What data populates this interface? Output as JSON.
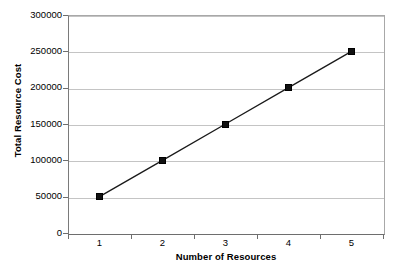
{
  "chart_data": {
    "type": "line",
    "title": "",
    "xlabel": "Number of Resources",
    "ylabel": "Total Resource Cost",
    "categories": [
      "1",
      "2",
      "3",
      "4",
      "5"
    ],
    "values": [
      50000,
      100000,
      150000,
      200000,
      250000
    ],
    "series": [
      {
        "name": "Total Resource Cost",
        "values": [
          50000,
          100000,
          150000,
          200000,
          250000
        ]
      }
    ],
    "ylim": [
      0,
      300000
    ],
    "ytick_labels": [
      "0",
      "50000",
      "100000",
      "150000",
      "200000",
      "250000",
      "300000"
    ],
    "ytick_values": [
      0,
      50000,
      100000,
      150000,
      200000,
      250000,
      300000
    ],
    "xtick_labels": [
      "1",
      "2",
      "3",
      "4",
      "5"
    ],
    "grid": "horizontal",
    "grid_color": "#c4c4c4",
    "legend": "none",
    "marker": "square",
    "marker_color": "#111111",
    "line_color": "#1a1a1a",
    "background": "#ffffff",
    "plot_background": "#ffffff",
    "axis_color": "#6e6e6e"
  }
}
